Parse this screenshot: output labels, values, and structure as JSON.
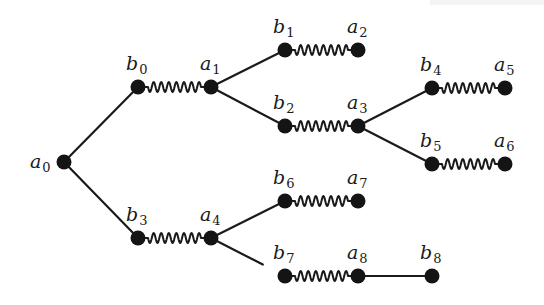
{
  "diagram": {
    "type": "tree-with-springs",
    "nodes": [
      {
        "id": "a0",
        "base": "a",
        "sub": "0",
        "x": 64,
        "y": 162,
        "label_dx": -34,
        "label_dy": 6
      },
      {
        "id": "b0",
        "base": "b",
        "sub": "0",
        "x": 138,
        "y": 87,
        "label_dx": -12,
        "label_dy": -17
      },
      {
        "id": "a1",
        "base": "a",
        "sub": "1",
        "x": 211,
        "y": 87,
        "label_dx": -11,
        "label_dy": -17
      },
      {
        "id": "b1",
        "base": "b",
        "sub": "1",
        "x": 285,
        "y": 50,
        "label_dx": -12,
        "label_dy": -17
      },
      {
        "id": "a2",
        "base": "a",
        "sub": "2",
        "x": 358,
        "y": 50,
        "label_dx": -11,
        "label_dy": -17
      },
      {
        "id": "b2",
        "base": "b",
        "sub": "2",
        "x": 285,
        "y": 126,
        "label_dx": -12,
        "label_dy": -17
      },
      {
        "id": "a3",
        "base": "a",
        "sub": "3",
        "x": 358,
        "y": 126,
        "label_dx": -11,
        "label_dy": -17
      },
      {
        "id": "b4",
        "base": "b",
        "sub": "4",
        "x": 432,
        "y": 88,
        "label_dx": -12,
        "label_dy": -17
      },
      {
        "id": "a5",
        "base": "a",
        "sub": "5",
        "x": 505,
        "y": 88,
        "label_dx": -11,
        "label_dy": -17
      },
      {
        "id": "b5",
        "base": "b",
        "sub": "5",
        "x": 432,
        "y": 164,
        "label_dx": -12,
        "label_dy": -17
      },
      {
        "id": "a6",
        "base": "a",
        "sub": "6",
        "x": 505,
        "y": 164,
        "label_dx": -11,
        "label_dy": -17
      },
      {
        "id": "b3",
        "base": "b",
        "sub": "3",
        "x": 138,
        "y": 238,
        "label_dx": -12,
        "label_dy": -17
      },
      {
        "id": "a4",
        "base": "a",
        "sub": "4",
        "x": 211,
        "y": 238,
        "label_dx": -11,
        "label_dy": -17
      },
      {
        "id": "b6",
        "base": "b",
        "sub": "6",
        "x": 285,
        "y": 201,
        "label_dx": -12,
        "label_dy": -17
      },
      {
        "id": "a7",
        "base": "a",
        "sub": "7",
        "x": 358,
        "y": 201,
        "label_dx": -11,
        "label_dy": -17
      },
      {
        "id": "b7",
        "base": "b",
        "sub": "7",
        "x": 285,
        "y": 276,
        "label_dx": -12,
        "label_dy": -17
      },
      {
        "id": "a8",
        "base": "a",
        "sub": "8",
        "x": 358,
        "y": 276,
        "label_dx": -11,
        "label_dy": -17
      },
      {
        "id": "b8",
        "base": "b",
        "sub": "8",
        "x": 432,
        "y": 276,
        "label_dx": -12,
        "label_dy": -17
      }
    ],
    "edges": [
      {
        "from": "a0",
        "to": "b0",
        "kind": "line"
      },
      {
        "from": "a0",
        "to": "b3",
        "kind": "line"
      },
      {
        "from": "b0",
        "to": "a1",
        "kind": "spring"
      },
      {
        "from": "a1",
        "to": "b1",
        "kind": "line"
      },
      {
        "from": "a1",
        "to": "b2",
        "kind": "line"
      },
      {
        "from": "b1",
        "to": "a2",
        "kind": "spring"
      },
      {
        "from": "b2",
        "to": "a3",
        "kind": "spring"
      },
      {
        "from": "a3",
        "to": "b4",
        "kind": "line"
      },
      {
        "from": "a3",
        "to": "b5",
        "kind": "line"
      },
      {
        "from": "b4",
        "to": "a5",
        "kind": "spring"
      },
      {
        "from": "b5",
        "to": "a6",
        "kind": "spring"
      },
      {
        "from": "b3",
        "to": "a4",
        "kind": "spring"
      },
      {
        "from": "a4",
        "to": "b6",
        "kind": "line"
      },
      {
        "from": "a4",
        "to": "b7",
        "kind": "line",
        "partial": 0.7
      },
      {
        "from": "b6",
        "to": "a7",
        "kind": "spring"
      },
      {
        "from": "b7",
        "to": "a8",
        "kind": "spring"
      },
      {
        "from": "a8",
        "to": "b8",
        "kind": "line"
      }
    ],
    "style": {
      "node_color": "#141414",
      "edge_color": "#1a1a1a",
      "background": "#ffffff",
      "node_radius": 7.5
    }
  }
}
